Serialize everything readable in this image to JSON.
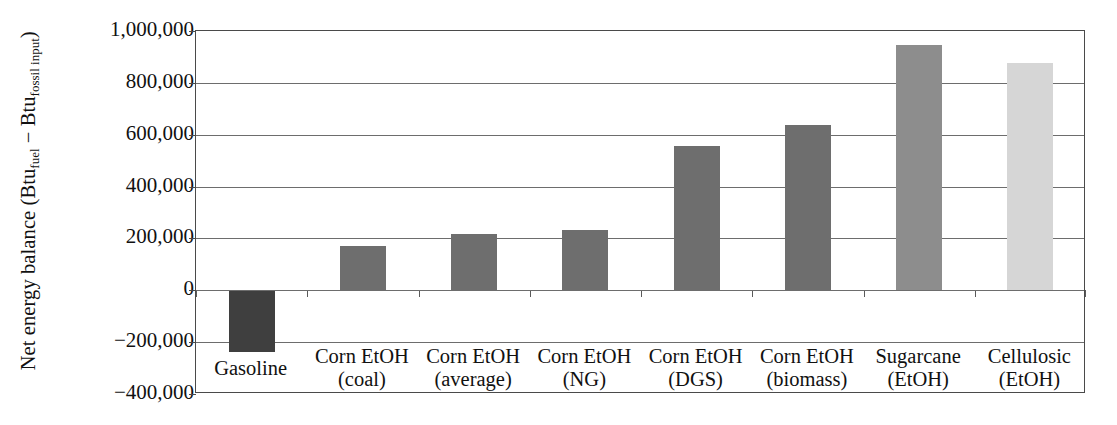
{
  "chart_data": {
    "type": "bar",
    "title": "",
    "xlabel": "",
    "ylabel": "Net energy balance (Btu_fuel − Btu_fossil input)",
    "ylabel_parts": {
      "prefix": "Net energy balance (Btu",
      "sub1": "fuel",
      "middle": " − Btu",
      "sub2": "fossil input",
      "suffix": ")"
    },
    "categories": [
      "Gasoline",
      "Corn EtOH (coal)",
      "Corn EtOH (average)",
      "Corn EtOH (NG)",
      "Corn EtOH (DGS)",
      "Corn EtOH (biomass)",
      "Sugarcane (EtOH)",
      "Cellulosic (EtOH)"
    ],
    "category_lines": [
      [
        "Gasoline",
        ""
      ],
      [
        "Corn EtOH",
        "(coal)"
      ],
      [
        "Corn EtOH",
        "(average)"
      ],
      [
        "Corn EtOH",
        "(NG)"
      ],
      [
        "Corn EtOH",
        "(DGS)"
      ],
      [
        "Corn EtOH",
        "(biomass)"
      ],
      [
        "Sugarcane",
        "(EtOH)"
      ],
      [
        "Cellulosic",
        "(EtOH)"
      ]
    ],
    "values": [
      -238000,
      169000,
      219000,
      231000,
      558000,
      638000,
      946000,
      877000
    ],
    "bar_colors": [
      "#3f3f3f",
      "#6e6e6e",
      "#6e6e6e",
      "#6e6e6e",
      "#6e6e6e",
      "#6e6e6e",
      "#8d8d8d",
      "#d6d6d6"
    ],
    "ylim": [
      -400000,
      1000000
    ],
    "ytick_values": [
      1000000,
      800000,
      600000,
      400000,
      200000,
      0,
      -200000,
      -400000
    ],
    "ytick_labels": [
      "1,000,000",
      "800,000",
      "600,000",
      "400,000",
      "200,000",
      "0",
      "−200,000",
      "−400,000"
    ],
    "grid": true,
    "grid_axis": "y",
    "legend": "none",
    "zero_line": 0
  }
}
